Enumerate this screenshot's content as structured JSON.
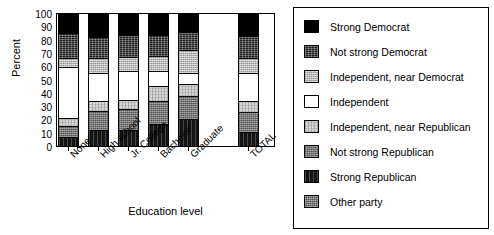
{
  "chart_data": {
    "type": "bar",
    "subtype": "stacked-100-percent",
    "title": "",
    "xlabel": "Education level",
    "ylabel": "Percent",
    "ylim": [
      0,
      100
    ],
    "ytick_step": 10,
    "yminor_step": 2,
    "grid": false,
    "legend_position": "right",
    "categories": [
      "None",
      "High school",
      "Jr. College",
      "Bachelor",
      "Graduate",
      "TOTAL"
    ],
    "category_gap_after": 4,
    "ytick_labels": [
      "0",
      "10",
      "20",
      "30",
      "40",
      "50",
      "60",
      "70",
      "80",
      "90",
      "100"
    ],
    "series": [
      {
        "name": "Strong Democrat",
        "fill": "f-solid-black",
        "values": [
          14,
          17,
          15,
          15,
          13,
          16
        ]
      },
      {
        "name": "Not strong Democrat",
        "fill": "f-dark-noise",
        "values": [
          19,
          16,
          17,
          16,
          14,
          17
        ]
      },
      {
        "name": "Independent, near Democrat",
        "fill": "f-lightgray-dot",
        "values": [
          7,
          11,
          11,
          12,
          17,
          11
        ]
      },
      {
        "name": "Independent",
        "fill": "f-white",
        "values": [
          39,
          22,
          22,
          11,
          9,
          22
        ]
      },
      {
        "name": "Independent, near Republican",
        "fill": "f-palegray-dot",
        "values": [
          6,
          7,
          7,
          12,
          9,
          8
        ]
      },
      {
        "name": "Not strong Republican",
        "fill": "f-midgray-noise",
        "values": [
          8,
          15,
          16,
          17,
          17,
          15
        ]
      },
      {
        "name": "Strong Republican",
        "fill": "f-verydark",
        "values": [
          7,
          12,
          12,
          17,
          21,
          11
        ]
      },
      {
        "name": "Other party",
        "fill": "f-darkgray-check",
        "values": [
          0,
          0,
          0,
          0,
          0,
          0
        ]
      }
    ]
  }
}
